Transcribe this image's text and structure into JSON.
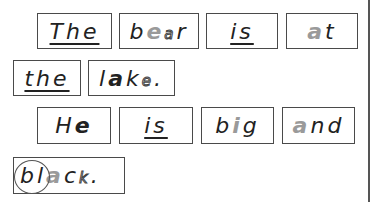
{
  "page": {
    "lines": [
      {
        "words": [
          {
            "id": "the-1",
            "text": "The",
            "underlined": true
          },
          {
            "id": "bear",
            "text": "bear",
            "parts": [
              {
                "t": "b",
                "style": "normal"
              },
              {
                "t": "e",
                "style": "grey"
              },
              {
                "t": "a",
                "style": "dotted"
              },
              {
                "t": "r",
                "style": "normal"
              }
            ]
          },
          {
            "id": "is-1",
            "text": "is",
            "underlined": true
          },
          {
            "id": "at",
            "text": "at",
            "parts": [
              {
                "t": "a",
                "style": "grey"
              },
              {
                "t": "t",
                "style": "normal"
              }
            ]
          }
        ]
      },
      {
        "words": [
          {
            "id": "the-2",
            "text": "the",
            "underlined": true
          },
          {
            "id": "lake",
            "text": "lake.",
            "parts": [
              {
                "t": "l",
                "style": "normal"
              },
              {
                "t": "a",
                "style": "bold"
              },
              {
                "t": "k",
                "style": "normal"
              },
              {
                "t": "e",
                "style": "dotted"
              },
              {
                "t": ".",
                "style": "normal"
              }
            ]
          }
        ]
      },
      {
        "words": [
          {
            "id": "he",
            "text": "He",
            "parts": [
              {
                "t": "H",
                "style": "normal"
              },
              {
                "t": "e",
                "style": "bold"
              }
            ]
          },
          {
            "id": "is-2",
            "text": "is",
            "underlined": true
          },
          {
            "id": "big",
            "text": "big",
            "parts": [
              {
                "t": "b",
                "style": "normal"
              },
              {
                "t": "i",
                "style": "grey"
              },
              {
                "t": "g",
                "style": "normal"
              }
            ]
          },
          {
            "id": "and",
            "text": "and",
            "parts": [
              {
                "t": "a",
                "style": "grey"
              },
              {
                "t": "n",
                "style": "normal"
              },
              {
                "t": "d",
                "style": "normal"
              }
            ]
          }
        ]
      },
      {
        "words": [
          {
            "id": "black",
            "text": "black.",
            "circled": "bl",
            "parts": [
              {
                "t": "b",
                "style": "normal"
              },
              {
                "t": "l",
                "style": "normal"
              },
              {
                "t": "a",
                "style": "grey"
              },
              {
                "t": "c",
                "style": "normal"
              },
              {
                "t": "k",
                "style": "dotted"
              },
              {
                "t": ".",
                "style": "normal"
              }
            ]
          }
        ]
      }
    ]
  },
  "words": {
    "the1": "The",
    "bear": [
      "b",
      "e",
      "a",
      "r"
    ],
    "is1": "is",
    "at": [
      "a",
      "t"
    ],
    "the2": "the",
    "lake": [
      "l",
      "a",
      "k",
      "e",
      "."
    ],
    "he": [
      "H",
      "e"
    ],
    "is2": "is",
    "big": [
      "b",
      "i",
      "g"
    ],
    "and": [
      "a",
      "n",
      "d"
    ],
    "black": [
      "b",
      "l",
      "a",
      "c",
      "k",
      "."
    ]
  },
  "colors": {
    "text": "#222222",
    "highlight_grey": "#9a9a9a",
    "border": "#4a4a4a"
  }
}
